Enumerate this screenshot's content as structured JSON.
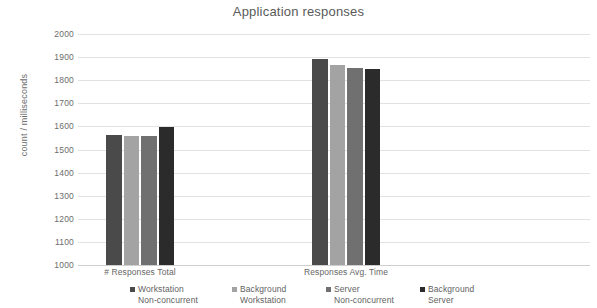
{
  "chart_data": {
    "type": "bar",
    "title": "Application responses",
    "xlabel": "",
    "ylabel": "count / milliseconds",
    "ylim": [
      1000,
      2000
    ],
    "ytick_step": 100,
    "yticks": [
      2000,
      1900,
      1800,
      1700,
      1600,
      1500,
      1400,
      1300,
      1200,
      1100,
      1000
    ],
    "grid": true,
    "legend_position": "bottom",
    "categories": [
      "# Responses Total",
      "Responses Avg. Time"
    ],
    "series": [
      {
        "name": "Workstation\nNon-concurrent",
        "color": "#4a4a4a",
        "values": [
          1563,
          1890
        ]
      },
      {
        "name": "Background\nWorkstation",
        "color": "#a3a3a3",
        "values": [
          1560,
          1868
        ]
      },
      {
        "name": "Server\nNon-concurrent",
        "color": "#707070",
        "values": [
          1558,
          1852
        ]
      },
      {
        "name": "Background\nServer",
        "color": "#2b2b2b",
        "values": [
          1597,
          1848
        ]
      }
    ]
  }
}
